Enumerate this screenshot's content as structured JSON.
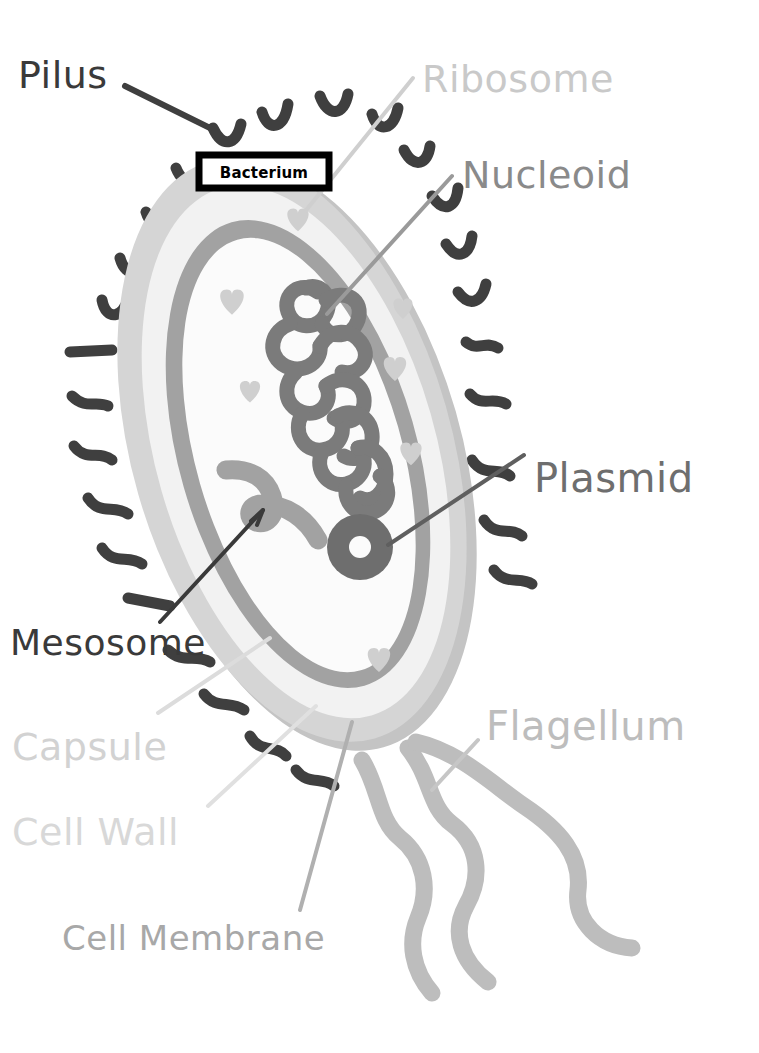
{
  "diagram": {
    "title": "Bacterium",
    "title_box": {
      "label": "Bacterium",
      "border_color": "#000000",
      "fill_color": "#ffffff",
      "text_color": "#000000"
    },
    "background_color": "#ffffff"
  },
  "labels": [
    {
      "id": "pilus",
      "text": "Pilus",
      "color": "#3a3a3a",
      "x": 18,
      "y": 88,
      "font_size": 38,
      "leader": true
    },
    {
      "id": "ribosome",
      "text": "Ribosome",
      "color": "#c9c9c9",
      "x": 422,
      "y": 92,
      "font_size": 38,
      "leader": true
    },
    {
      "id": "nucleoid",
      "text": "Nucleoid",
      "color": "#8a8a8a",
      "x": 462,
      "y": 188,
      "font_size": 38,
      "leader": true
    },
    {
      "id": "plasmid",
      "text": "Plasmid",
      "color": "#6e6e6e",
      "x": 534,
      "y": 492,
      "font_size": 40,
      "leader": true
    },
    {
      "id": "mesosome",
      "text": "Mesosome",
      "color": "#3a3a3a",
      "x": 10,
      "y": 655,
      "font_size": 36,
      "leader": true
    },
    {
      "id": "capsule",
      "text": "Capsule",
      "color": "#d2d2d2",
      "x": 12,
      "y": 760,
      "font_size": 38,
      "leader": true
    },
    {
      "id": "cell-wall",
      "text": "Cell Wall",
      "color": "#d8d8d8",
      "x": 12,
      "y": 845,
      "font_size": 38,
      "leader": true
    },
    {
      "id": "flagellum",
      "text": "Flagellum",
      "color": "#bdbdbd",
      "x": 486,
      "y": 740,
      "font_size": 40,
      "leader": true
    },
    {
      "id": "cell-membrane",
      "text": "Cell Membrane",
      "color": "#a8a8a8",
      "x": 62,
      "y": 950,
      "font_size": 34,
      "leader": true
    }
  ],
  "structures": {
    "capsule": {
      "name": "capsule",
      "color": "#d5d5d5"
    },
    "capsule_shadow": {
      "name": "capsule-shadow",
      "color": "#c4c4c4"
    },
    "cell_wall": {
      "name": "cell-wall",
      "color": "#f2f2f2"
    },
    "cell_membrane": {
      "name": "cell-membrane",
      "color": "#a2a2a2"
    },
    "cytoplasm": {
      "name": "cytoplasm",
      "color": "#fbfbfb"
    },
    "nucleoid": {
      "name": "nucleoid-dna",
      "color": "#7b7b7b"
    },
    "plasmid": {
      "name": "plasmid-ring",
      "color": "#6e6e6e"
    },
    "ribosome": {
      "name": "ribosome-heart",
      "color": "#cfcfcf"
    },
    "pili": {
      "name": "pilus-strand",
      "color": "#3f3f3f",
      "count": 24
    },
    "flagella": {
      "name": "flagellum-strand",
      "color": "#bdbdbd",
      "count": 3
    },
    "mesosome": {
      "name": "mesosome-infold",
      "color": "#a2a2a2"
    }
  },
  "leader_lines": {
    "pilus_color": "#3f3f3f",
    "ribosome_color": "#cfcfcf",
    "nucleoid_color": "#9a9a9a",
    "plasmid_color": "#5f5f5f",
    "mesosome_color": "#3a3a3a",
    "capsule_color": "#dcdcdc",
    "cell_wall_color": "#e0e0e0",
    "flagellum_color": "#c6c6c6",
    "cell_membrane_color": "#b0b0b0"
  }
}
